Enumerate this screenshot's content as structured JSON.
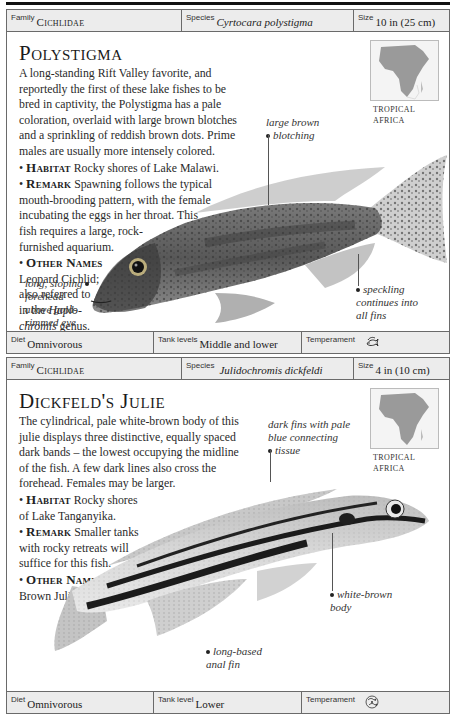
{
  "entries": [
    {
      "family_label": "Family",
      "family": "Cichlidae",
      "species_label": "Species",
      "species": "Cyrtocara polystigma",
      "size_label": "Size",
      "size": "10 in (25 cm)",
      "title": "Polystigma",
      "description": "A long-standing Rift Valley favorite, and reportedly the first of these lake fishes to be bred in captivity, the Polystigma has a pale coloration, overlaid with large brown blotches and a sprinkling of reddish brown dots. Prime males are usually more intensely colored.",
      "habitat_label": "Habitat",
      "habitat": "Rocky shores of Lake Malawi.",
      "remark_label": "Remark",
      "remark": "Spawning follows the typical mouth-brooding pattern, with the female incubating the eggs in her throat. This fish requires a large, rock-furnished aquarium.",
      "other_names_label": "Other Names",
      "other_names": "Leopard Cichlid; also referred to in the Haplochromis genus.",
      "map_region": "TROPICAL AFRICA",
      "callouts": [
        "large brown blotching",
        "long, sloping forehead above gold-rimmed eye",
        "speckling continues into all fins"
      ],
      "diet_label": "Diet",
      "diet": "Omnivorous",
      "tank_label": "Tank levels",
      "tank": "Middle and lower",
      "temperament_label": "Temperament",
      "temperament_icon": "fish-pair-aggressive-icon"
    },
    {
      "family_label": "Family",
      "family": "Cichlidae",
      "species_label": "Species",
      "species": "Julidochromis dickfeldi",
      "size_label": "Size",
      "size": "4 in (10 cm)",
      "title": "Dickfeld's Julie",
      "description": "The cylindrical, pale white-brown body of this julie displays three distinctive, equally spaced dark bands – the lowest occupying the midline of the fish. A few dark lines also cross the forehead. Females may be larger.",
      "habitat_label": "Habitat",
      "habitat": "Rocky shores of Lake Tanganyika.",
      "remark_label": "Remark",
      "remark": "Smaller tanks with rocky retreats will suffice for this fish.",
      "other_names_label": "Other Name",
      "other_names": "Brown Julie.",
      "map_region": "TROPICAL AFRICA",
      "callouts": [
        "dark fins with pale blue connecting tissue",
        "white-brown body",
        "long-based anal fin"
      ],
      "diet_label": "Diet",
      "diet": "Omnivorous",
      "tank_label": "Tank level",
      "tank": "Lower",
      "temperament_label": "Temperament",
      "temperament_icon": "fish-group-semi-aggressive-icon"
    }
  ],
  "text": {
    "e0_desc_lines": [
      "A long-standing Rift Valley favorite, and",
      "reportedly the first of these lake fishes to be",
      "bred in captivity, the Polystigma has a pale",
      "coloration, overlaid with large brown blotches",
      "and a sprinkling of reddish brown dots. Prime",
      "males are usually more intensely colored."
    ],
    "e0_remark_lines": [
      "mouth-brooding pattern, with the female",
      "incubating the eggs in her throat. This",
      "fish requires a large, rock-",
      "furnished aquarium."
    ],
    "e0_remark_first": "Spawning follows the typical",
    "e0_other_lines": [
      "Leopard Cichlid;",
      "also referred to",
      "in the "
    ],
    "e0_haplo1": "Haplo-",
    "e0_haplo2": "chromis",
    "e0_genus": " genus.",
    "e0_call_blotch": [
      "large brown",
      "blotching"
    ],
    "e0_call_forehead": [
      "long, sloping",
      "forehead",
      "above gold-",
      "rimmed eye"
    ],
    "e0_call_speck": [
      "speckling",
      "continues into",
      "all fins"
    ],
    "e1_desc_lines": [
      "The cylindrical, pale white-brown body of this",
      "julie displays three distinctive, equally spaced",
      "dark bands – the lowest occupying the midline",
      "of the fish. A few dark lines also cross the",
      "forehead. Females may be larger."
    ],
    "e1_habitat_first": "Rocky shores",
    "e1_habitat_second": "of Lake Tanganyika.",
    "e1_remark_first": "Smaller tanks",
    "e1_remark_lines": [
      "with rocky retreats will",
      "suffice for this fish."
    ],
    "e1_call_fins": [
      "dark fins with pale",
      "blue connecting",
      "tissue"
    ],
    "e1_call_body": [
      "white-brown",
      "body"
    ],
    "e1_call_anal": [
      "long-based",
      "anal fin"
    ],
    "map_l1": "TROPICAL",
    "map_l2": "AFRICA"
  }
}
